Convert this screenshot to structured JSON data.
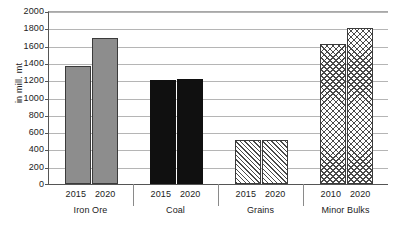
{
  "chart_data": {
    "type": "bar",
    "title": "",
    "xlabel": "",
    "ylabel": "in mill. mt",
    "ylim": [
      0,
      2000
    ],
    "ytick_step": 200,
    "yticks": [
      2000,
      1800,
      1600,
      1400,
      1200,
      1000,
      800,
      600,
      400,
      200,
      0
    ],
    "grid": true,
    "legend": "none",
    "categories": [
      "Iron Ore",
      "Coal",
      "Grains",
      "Minor Bulks"
    ],
    "groups": [
      {
        "category": "Iron Ore",
        "bars": [
          {
            "label": "2015",
            "value": 1370,
            "fill": "solid-gray"
          },
          {
            "label": "2020",
            "value": 1690,
            "fill": "solid-gray"
          }
        ]
      },
      {
        "category": "Coal",
        "bars": [
          {
            "label": "2015",
            "value": 1200,
            "fill": "solid-black"
          },
          {
            "label": "2020",
            "value": 1215,
            "fill": "solid-black"
          }
        ]
      },
      {
        "category": "Grains",
        "bars": [
          {
            "label": "2015",
            "value": 505,
            "fill": "diagonal"
          },
          {
            "label": "2020",
            "value": 510,
            "fill": "diagonal"
          }
        ]
      },
      {
        "category": "Minor Bulks",
        "bars": [
          {
            "label": "2010",
            "value": 1620,
            "fill": "crosshatch"
          },
          {
            "label": "2020",
            "value": 1800,
            "fill": "crosshatch"
          }
        ]
      }
    ],
    "colors": {
      "solid-gray": "#8d8d8d",
      "solid-black": "#101010",
      "hatch": "#4a4a4a",
      "gridline": "#b5b5b5",
      "axis": "#555555",
      "background": "#ffffff"
    }
  }
}
